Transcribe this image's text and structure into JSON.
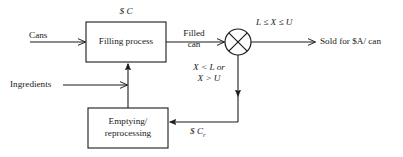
{
  "diagram": {
    "type": "process-flow-block-diagram",
    "stroke_color": "#1a1a1a",
    "background_color": "#ffffff",
    "blocks": [
      {
        "id": "filling-process",
        "label": "Filling process",
        "x": 86,
        "y": 22,
        "w": 80,
        "h": 40
      },
      {
        "id": "emptying-reprocessing",
        "label_line1": "Emptying/",
        "label_line2": "reprocessing",
        "x": 88,
        "y": 108,
        "w": 80,
        "h": 40
      }
    ],
    "junction": {
      "id": "inspection-node",
      "shape": "crossed-circle",
      "cx": 238,
      "cy": 42,
      "r": 13
    },
    "labels": {
      "cost_filling": "$ C",
      "input_cans": "Cans",
      "input_ingredients": "Ingredients",
      "filled_can_line1": "Filled",
      "filled_can_line2": "can",
      "accept_condition": "L ≤ X ≤ U",
      "sold_for": "Sold  for $A/ can",
      "reject_condition_line1": "X < L or",
      "reject_condition_line2": "X > U",
      "cost_reprocessing_prefix": "$ C",
      "cost_reprocessing_subscript": "r"
    }
  }
}
